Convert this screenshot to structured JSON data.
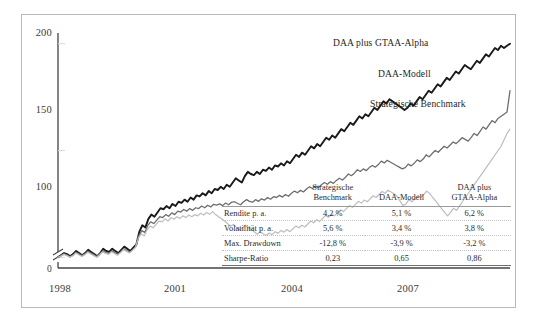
{
  "chart_data": {
    "type": "line",
    "title": "",
    "xlabel": "",
    "ylabel": "",
    "xlim": [
      1998,
      2009.25
    ],
    "ylim": [
      95,
      205
    ],
    "yticks": [
      100,
      150,
      200
    ],
    "xticks": [
      1998,
      2001,
      2004,
      2007
    ],
    "zero_label": "0",
    "axis_break": true,
    "grid": false,
    "legend_position": "inline-annotations",
    "series": [
      {
        "name": "DAA plus GTAA-Alpha",
        "color": "#1a1a1a",
        "width": 1.9,
        "annotation": "DAA plus GTAA-Alpha",
        "values": [
          100,
          101,
          102,
          101.5,
          100.5,
          101.5,
          103,
          102,
          101,
          102,
          103.5,
          102.5,
          101.5,
          100.5,
          102,
          104,
          103,
          102.5,
          104,
          103,
          102,
          103.5,
          105,
          104,
          103,
          104.5,
          106,
          112,
          115,
          114,
          118,
          120,
          119,
          121,
          123,
          122.5,
          124,
          123,
          125,
          124,
          126,
          125.5,
          127,
          126,
          128,
          127,
          129,
          128.5,
          130,
          129,
          131,
          130,
          132,
          131.5,
          133,
          132,
          134,
          133,
          135,
          137,
          136,
          135,
          138,
          140,
          139,
          138.5,
          140,
          139,
          141,
          140.5,
          142,
          141,
          143,
          142.5,
          144,
          143,
          145,
          144,
          146,
          148,
          147,
          149,
          148,
          150,
          152,
          151,
          153,
          152,
          154,
          156,
          155,
          157,
          156,
          158,
          160,
          159,
          161,
          163,
          162,
          164,
          166,
          165,
          167,
          166,
          168,
          170,
          169,
          171,
          173,
          172,
          174,
          173,
          172,
          171,
          170,
          169,
          170,
          172,
          171,
          173,
          175,
          174,
          176,
          178,
          177,
          179,
          181,
          180,
          182,
          184,
          183,
          185,
          187,
          186,
          188,
          190,
          189,
          188,
          190,
          192,
          191,
          193,
          195,
          194,
          196,
          198,
          197,
          199,
          198,
          199,
          200
        ]
      },
      {
        "name": "DAA-Modell",
        "color": "#6e6e6e",
        "width": 1.3,
        "annotation": "DAA-Modell",
        "values": [
          100,
          100.8,
          101.6,
          101,
          100.2,
          101,
          102.4,
          101.6,
          100.8,
          101.6,
          102.8,
          102,
          101.2,
          100.4,
          101.6,
          103,
          102.2,
          101.8,
          103,
          102.2,
          101.4,
          102.6,
          104,
          103.2,
          102.4,
          103.6,
          105,
          110,
          112.5,
          111.6,
          115,
          116.6,
          115.8,
          117.4,
          119,
          118.6,
          120,
          119.2,
          120.8,
          120,
          121.6,
          121.2,
          122.4,
          121.6,
          122.8,
          122,
          123.2,
          122.8,
          124,
          123.2,
          124.4,
          123.6,
          124.8,
          124.4,
          125,
          124.2,
          125.4,
          124.6,
          125.8,
          126,
          125.2,
          124.6,
          126,
          127,
          126.2,
          125.8,
          127,
          126.2,
          127.4,
          126.8,
          128,
          127.2,
          128.4,
          128,
          129,
          128.2,
          129.4,
          128.6,
          130,
          131,
          130.2,
          131.4,
          130.6,
          132,
          133,
          132.2,
          133.4,
          132.6,
          134,
          135,
          134.2,
          135.4,
          134.6,
          136,
          137,
          136.2,
          137.4,
          139,
          138.2,
          139.4,
          141,
          140.2,
          141.4,
          140.6,
          142,
          143,
          142.2,
          143.4,
          145,
          144.2,
          145.4,
          144.6,
          143.8,
          143,
          142.2,
          141.4,
          142,
          143.6,
          142.8,
          144,
          145.6,
          144.8,
          146,
          148,
          147,
          148.6,
          150,
          149.2,
          150.6,
          152,
          151.2,
          152.6,
          154,
          153.2,
          154.6,
          156,
          155.2,
          154.4,
          156,
          158,
          157,
          159,
          161,
          160,
          162,
          164,
          163,
          165,
          166,
          167,
          168,
          178
        ]
      },
      {
        "name": "Strategische Benchmark",
        "color": "#bdbdbd",
        "width": 1.2,
        "annotation": "Strategische Benchmark",
        "values": [
          100,
          100.6,
          101.4,
          100.8,
          100,
          100.8,
          102,
          101.2,
          100.4,
          101.2,
          102.4,
          101.6,
          100.8,
          100,
          101.2,
          102.6,
          101.8,
          101.4,
          102.6,
          101.8,
          101,
          102.2,
          103.6,
          102.8,
          102,
          103.2,
          104.6,
          109,
          111,
          110,
          113,
          114.6,
          113.8,
          115.4,
          117,
          116.6,
          118,
          117,
          118.6,
          117.8,
          119,
          118.2,
          119.4,
          118.6,
          119.8,
          119,
          120,
          119.4,
          120.6,
          119.8,
          121,
          120.2,
          121.4,
          120,
          119,
          118,
          117,
          115.8,
          114.6,
          115.4,
          114,
          112.8,
          113.6,
          115,
          114,
          113,
          112,
          110.8,
          112,
          111,
          110.2,
          111.4,
          110.6,
          112,
          111.2,
          112.6,
          111.8,
          113,
          112,
          113.4,
          114.6,
          113.8,
          115,
          114.2,
          115.6,
          117,
          116.2,
          117.6,
          116.8,
          118.2,
          119.6,
          118.8,
          120.2,
          119.4,
          120.8,
          122.2,
          121.4,
          122.8,
          124.2,
          123.4,
          124.8,
          126.2,
          125.4,
          126.8,
          126,
          127.4,
          128.8,
          128,
          129.4,
          130.8,
          130,
          131.4,
          130.6,
          129.8,
          128.6,
          126.4,
          124.2,
          125,
          127,
          126,
          127.6,
          129,
          128,
          129.4,
          131,
          129.8,
          128,
          126.4,
          124.6,
          122.8,
          121,
          119.4,
          121,
          123,
          122,
          124,
          126,
          128,
          130,
          132,
          134,
          136,
          138,
          140,
          142,
          144,
          146,
          148,
          150,
          152,
          155,
          158,
          160
        ]
      }
    ]
  },
  "annotations": {
    "daa_plus": "DAA plus GTAA-Alpha",
    "daa_modell": "DAA-Modell",
    "benchmark": "Strategische Benchmark"
  },
  "stats_table": {
    "corner_label": "",
    "columns": [
      "Strategische\nBenchmark",
      "DAA-Modell",
      "DAA plus\nGTAA-Alpha"
    ],
    "columns_lines": [
      [
        "Strategische",
        "Benchmark"
      ],
      [
        "DAA-Modell",
        ""
      ],
      [
        "DAA plus",
        "GTAA-Alpha"
      ]
    ],
    "rows": [
      {
        "label": "Rendite p. a.",
        "values": [
          "4,2 %",
          "5,1 %",
          "6,2 %"
        ]
      },
      {
        "label": "Volatilität p. a.",
        "values": [
          "5,6 %",
          "3,4 %",
          "3,8 %"
        ]
      },
      {
        "label": "Max. Drawdown",
        "values": [
          "-12,8 %",
          "-3,9 %",
          "-3,2 %"
        ]
      },
      {
        "label": "Sharpe-Ratio",
        "values": [
          "0,23",
          "0,65",
          "0,86"
        ]
      }
    ]
  },
  "axis": {
    "y_labels": [
      "200",
      "150",
      "100"
    ],
    "x_labels": [
      "1998",
      "2001",
      "2004",
      "2007"
    ],
    "zero": "0"
  },
  "colors": {
    "line_dark": "#1a1a1a",
    "line_mid": "#6e6e6e",
    "line_light": "#bdbdbd",
    "frame": "#b9b9b9",
    "axis": "#444444"
  }
}
